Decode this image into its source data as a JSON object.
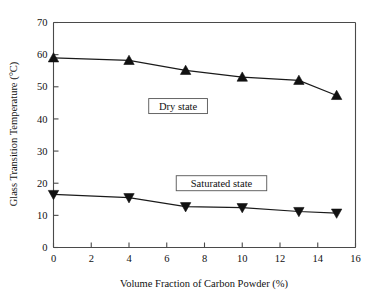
{
  "chart_data": {
    "type": "line",
    "title": "",
    "xlabel": "Volume Fraction of Carbon Powder (%)",
    "ylabel": "Glass Transition Temperature (°C)",
    "xlim": [
      0,
      16
    ],
    "ylim": [
      0,
      70
    ],
    "xticks": [
      0,
      2,
      4,
      6,
      8,
      10,
      12,
      14,
      16
    ],
    "yticks": [
      0,
      10,
      20,
      30,
      40,
      50,
      60,
      70
    ],
    "xtick_labels": [
      "0",
      "2",
      "4",
      "6",
      "8",
      "10",
      "12",
      "14",
      "16"
    ],
    "ytick_labels": [
      "0",
      "10",
      "20",
      "30",
      "40",
      "50",
      "60",
      "70"
    ],
    "grid": false,
    "legend_position": "inline-annotations",
    "x": [
      0,
      4,
      7,
      10,
      13,
      15
    ],
    "series": [
      {
        "name": "Dry state",
        "marker": "triangle-up",
        "color": "#111111",
        "values": [
          59.0,
          58.2,
          55.1,
          53.0,
          52.0,
          47.3
        ]
      },
      {
        "name": "Saturated state",
        "marker": "triangle-down",
        "color": "#111111",
        "values": [
          16.5,
          15.5,
          12.7,
          12.4,
          11.2,
          10.7
        ]
      }
    ],
    "annotations": [
      {
        "text": "Dry state",
        "x": 6.6,
        "y": 44.0,
        "boxed": true
      },
      {
        "text": "Saturated state",
        "x": 8.9,
        "y": 20.0,
        "boxed": true
      }
    ]
  }
}
